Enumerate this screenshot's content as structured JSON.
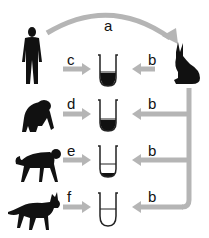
{
  "colors": {
    "arrow": "#b5b5b5",
    "silhouette": "#111111",
    "tube_outline": "#222222",
    "precipitate": "#111111",
    "background": "#ffffff"
  },
  "top_arrow": {
    "label": "a",
    "from": "human",
    "to": "rabbit"
  },
  "source": {
    "animal": "rabbit",
    "icon": "rabbit-icon"
  },
  "rows": [
    {
      "animal": "human",
      "icon": "human-icon",
      "left_label": "c",
      "right_label": "b",
      "precipitate_level": "large"
    },
    {
      "animal": "chimpanzee",
      "icon": "chimpanzee-icon",
      "left_label": "d",
      "right_label": "b",
      "precipitate_level": "large"
    },
    {
      "animal": "monkey",
      "icon": "monkey-icon",
      "left_label": "e",
      "right_label": "b",
      "precipitate_level": "small"
    },
    {
      "animal": "dog",
      "icon": "dog-icon",
      "left_label": "f",
      "right_label": "b",
      "precipitate_level": "none"
    }
  ]
}
